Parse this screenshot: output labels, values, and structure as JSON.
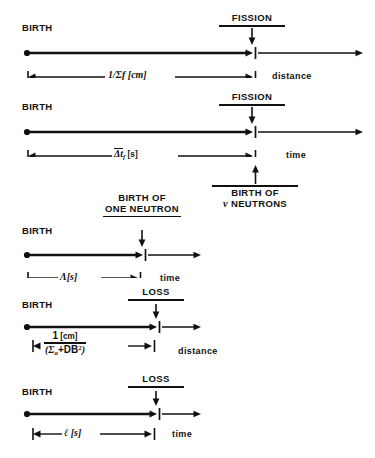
{
  "figure": {
    "caption": "",
    "background_color": "#ffffff",
    "ink_color": "#111111",
    "rows": [
      {
        "id": "fission-distance",
        "birth_label": "BIRTH",
        "event_label_lines": [
          "FISSION"
        ],
        "dimension_label": "1/Σf [cm]",
        "dimension_numerator": "1",
        "dimension_denominator": "Σf",
        "dimension_unit": "[cm]",
        "axis_label": "distance",
        "lower_event_label_lines": []
      },
      {
        "id": "fission-time",
        "birth_label": "BIRTH",
        "event_label_lines": [
          "FISSION"
        ],
        "dimension_label": "Δtf [s]",
        "dimension_unit": "[s]",
        "axis_label": "time",
        "lower_event_label_lines": [
          "BIRTH OF",
          "ν NEUTRONS"
        ]
      },
      {
        "id": "one-neutron-time",
        "birth_label": "BIRTH",
        "event_label_lines": [
          "BIRTH OF",
          "ONE NEUTRON"
        ],
        "dimension_label": "Λ[s]",
        "dimension_unit": "[s]",
        "axis_label": "time",
        "lower_event_label_lines": []
      },
      {
        "id": "loss-distance",
        "birth_label": "BIRTH",
        "event_label_lines": [
          "LOSS"
        ],
        "dimension_numerator": "1",
        "dimension_denominator": "(Σa+DB²)",
        "dimension_unit": "[cm]",
        "axis_label": "distance",
        "lower_event_label_lines": []
      },
      {
        "id": "loss-time",
        "birth_label": "BIRTH",
        "event_label_lines": [
          "LOSS"
        ],
        "dimension_label": "ℓ [s]",
        "dimension_unit": "[s]",
        "axis_label": "time",
        "lower_event_label_lines": []
      }
    ]
  }
}
